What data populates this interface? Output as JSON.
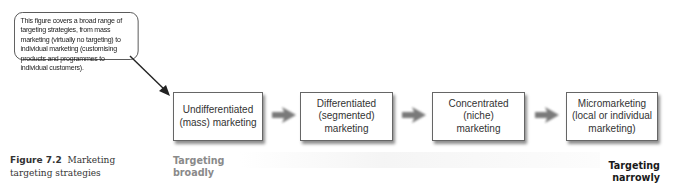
{
  "callout": {
    "text": "This figure covers a broad range of targeting strategies, from mass marketing (virtually no targeting) to individual marketing (customising products and programmes to individual customers)."
  },
  "caption": {
    "number": "Figure 7.2",
    "title": "Marketing targeting strategies"
  },
  "boxes": [
    {
      "lines": [
        "Undifferentiated",
        "(mass) marketing"
      ]
    },
    {
      "lines": [
        "Differentiated",
        "(segmented)",
        "marketing"
      ]
    },
    {
      "lines": [
        "Concentrated",
        "(niche)",
        "marketing"
      ]
    },
    {
      "lines": [
        "Micromarketing",
        "(local or individual",
        "marketing)"
      ]
    }
  ],
  "ends": {
    "broad": [
      "Targeting",
      "broadly"
    ],
    "narrow": [
      "Targeting",
      "narrowly"
    ]
  },
  "colors": {
    "arrow": "#7a7a7a",
    "broad_label": "#8a8a8a",
    "narrow_label": "#1a1a1a",
    "box_border": "#666666"
  }
}
